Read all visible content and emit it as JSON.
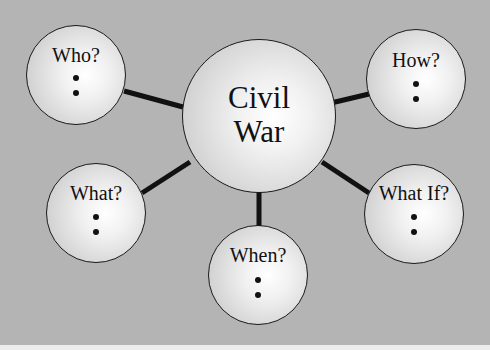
{
  "diagram": {
    "type": "mind-map",
    "center": {
      "label_line1": "Civil",
      "label_line2": "War",
      "cx": 259,
      "cy": 116,
      "r": 77
    },
    "nodes": [
      {
        "id": "who",
        "label": "Who?",
        "cx": 76,
        "cy": 75,
        "r": 50,
        "bullets": 2
      },
      {
        "id": "how",
        "label": "How?",
        "cx": 416,
        "cy": 79,
        "r": 50,
        "bullets": 2
      },
      {
        "id": "what",
        "label": "What?",
        "cx": 96,
        "cy": 213,
        "r": 50,
        "bullets": 2
      },
      {
        "id": "what-if",
        "label": "What If?",
        "cx": 414,
        "cy": 214,
        "r": 50,
        "bullets": 2
      },
      {
        "id": "when",
        "label": "When?",
        "cx": 258,
        "cy": 275,
        "r": 50,
        "bullets": 2
      }
    ],
    "colors": {
      "background": "#b4b4b4",
      "line": "#111111",
      "node_border": "#1a1a1a",
      "bottom_strip": "#ececec"
    }
  }
}
